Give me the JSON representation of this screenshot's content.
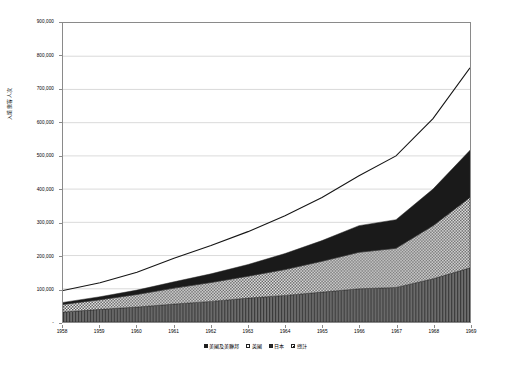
{
  "chart_data": {
    "type": "area",
    "stacked": true,
    "title": "",
    "xlabel": "",
    "ylabel": "入境旅客人次",
    "grid": true,
    "legend_position": "bottom",
    "categories": [
      "1958",
      "1959",
      "1960",
      "1961",
      "1962",
      "1963",
      "1964",
      "1965",
      "1966",
      "1967",
      "1968",
      "1969"
    ],
    "x": [
      1958,
      1959,
      1960,
      1961,
      1962,
      1963,
      1964,
      1965,
      1966,
      1967,
      1968,
      1969
    ],
    "ylim": [
      0,
      900000
    ],
    "ytick_values": [
      0,
      100000,
      200000,
      300000,
      400000,
      500000,
      600000,
      700000,
      800000,
      900000
    ],
    "ytick_labels": [
      "-",
      "100,000",
      "200,000",
      "300,000",
      "400,000",
      "500,000",
      "600,000",
      "700,000",
      "800,000",
      "900,000"
    ],
    "series": [
      {
        "name": "美國及美聯邦",
        "fill": "dark-vertical-hatch",
        "values": [
          30000,
          38000,
          45000,
          54000,
          62000,
          72000,
          80000,
          90000,
          100000,
          104000,
          130000,
          163000
        ]
      },
      {
        "name": "英國",
        "fill": "checkerboard",
        "values": [
          23000,
          29000,
          38000,
          48000,
          57000,
          66000,
          78000,
          93000,
          110000,
          118000,
          160000,
          212000
        ]
      },
      {
        "name": "日本",
        "fill": "solid-black",
        "values": [
          6000,
          9000,
          13000,
          19000,
          26000,
          35000,
          48000,
          62000,
          80000,
          86000,
          110000,
          142000
        ]
      }
    ],
    "total_line": {
      "name": "總計",
      "values": [
        95000,
        118000,
        150000,
        192000,
        230000,
        272000,
        320000,
        375000,
        440000,
        500000,
        612000,
        765000
      ]
    },
    "legend_entries": [
      {
        "label": "美國及美聯邦",
        "swatch": "dark"
      },
      {
        "label": "英國",
        "swatch": "checker"
      },
      {
        "label": "日本",
        "swatch": "black"
      },
      {
        "label": "總計",
        "swatch": "outline"
      }
    ]
  }
}
